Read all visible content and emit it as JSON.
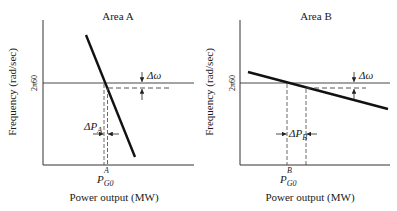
{
  "panels": [
    {
      "title": "Area A",
      "y_axis_label": "Frequency (rad/sec)",
      "x_axis_label": "Power output (MW)",
      "y_tick_label": "2π60",
      "delta_omega_label": "Δω",
      "delta_p_main": "ΔP",
      "delta_p_sub": "A",
      "p_main": "P",
      "p_sub": "G0",
      "p_sup": "A"
    },
    {
      "title": "Area B",
      "y_axis_label": "Frequency (rad/sec)",
      "x_axis_label": "Power output (MW)",
      "y_tick_label": "2π60",
      "delta_omega_label": "Δω",
      "delta_p_main": "ΔP",
      "delta_p_sub": "B",
      "p_main": "P",
      "p_sub": "G0",
      "p_sup": "B"
    }
  ],
  "colors": {
    "line": "#111111",
    "axis": "#333333",
    "dashed": "#444444"
  }
}
